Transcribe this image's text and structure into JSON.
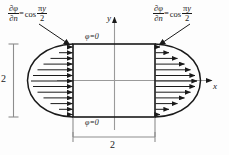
{
  "figure": {
    "background_color": "#fdfdfd",
    "line_color": "#1a1a1a",
    "axis_color": "#9a9a9a"
  },
  "labels": {
    "bc_left": {
      "partial": "∂",
      "phi": "φ",
      "n": "n",
      "equals": "=",
      "cos": "cos",
      "pi": "π",
      "y": "y",
      "two": "2",
      "full_text": "∂φ/∂n = cos(πy/2)"
    },
    "bc_right": {
      "partial": "∂",
      "phi": "φ",
      "n": "n",
      "equals": "=",
      "cos": "cos",
      "pi": "π",
      "y": "y",
      "two": "2",
      "full_text": "∂φ/∂n = cos(πy/2)"
    },
    "phi_top": "φ=0",
    "phi_bottom": "φ=0",
    "axis_y": "y",
    "axis_x": "x",
    "dim_vertical": "2",
    "dim_horizontal": "2"
  },
  "geometry": {
    "rect_width_units": "2",
    "rect_height_units": "2",
    "arrow_count_left": 13,
    "arrow_count_right": 13,
    "arrow_profile": "cosine"
  }
}
